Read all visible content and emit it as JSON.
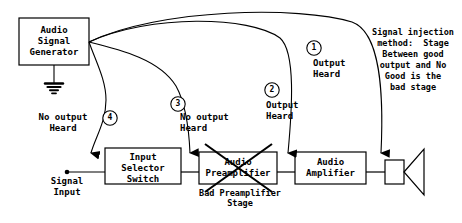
{
  "diagram": {
    "blocks": {
      "generator": "Audio\nSignal\nGenerator",
      "selector": "Input\nSelector\nSwitch",
      "preamp": "Audio\nPreamplifier",
      "amplifier": "Audio\nAmplifier"
    },
    "labels": {
      "signal_input": "Signal\nInput",
      "bad_stage": "Bad Preamplifier\nStage"
    },
    "markers": [
      {
        "number": "1",
        "text": "Output\nHeard"
      },
      {
        "number": "2",
        "text": "Output\nHeard"
      },
      {
        "number": "3",
        "text": "No output\nHeard"
      },
      {
        "number": "4",
        "text": "No output\nHeard"
      }
    ],
    "note": "Signal injection\nmethod:  Stage\nBetween good\noutput and No\nGood is the\nbad stage",
    "colors": {
      "line": "#000000",
      "background": "#ffffff"
    },
    "icons": {
      "ground": "ground-symbol",
      "speaker": "speaker-symbol",
      "cross": "cross-out-mark"
    }
  }
}
